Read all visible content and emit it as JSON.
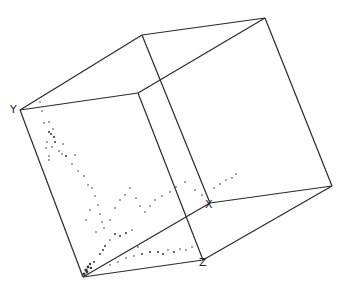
{
  "diagram": {
    "type": "3d-scatter-cube",
    "axis_labels": {
      "x": "X",
      "y": "Y",
      "z": "Z"
    },
    "colors": {
      "edge": "#2a2a2a",
      "points": "#333333",
      "background": "#ffffff"
    },
    "vertices": {
      "origin": [
        83,
        277
      ],
      "y_top": [
        20,
        110
      ],
      "x_end": [
        210,
        203
      ],
      "z_end": [
        203,
        260
      ],
      "back_top_left": [
        142,
        35
      ],
      "back_top_right": [
        265,
        18
      ],
      "back_right": [
        332,
        186
      ],
      "front_top_mid": [
        138,
        93
      ]
    },
    "label_positions": {
      "x": [
        206,
        207
      ],
      "y": [
        10,
        112
      ],
      "z": [
        199,
        265
      ]
    }
  }
}
